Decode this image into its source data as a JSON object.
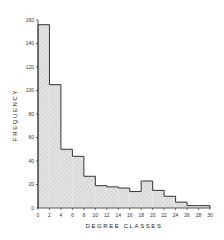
{
  "chart_data": {
    "type": "bar",
    "subtype": "histogram",
    "title": "",
    "xlabel": "DEGREE CLASSES",
    "ylabel": "FREQUENCY",
    "bin_edges": [
      0,
      2,
      4,
      6,
      8,
      10,
      12,
      14,
      16,
      18,
      20,
      22,
      24,
      26,
      28,
      30
    ],
    "categories": [
      "0-2",
      "2-4",
      "4-6",
      "6-8",
      "8-10",
      "10-12",
      "12-14",
      "14-16",
      "16-18",
      "18-20",
      "20-22",
      "22-24",
      "24-26",
      "26-28",
      "28-30"
    ],
    "values": [
      156,
      105,
      50,
      44,
      27,
      19,
      18,
      17,
      14,
      23,
      15,
      10,
      5,
      2,
      2
    ],
    "xlim": [
      0,
      30
    ],
    "ylim": [
      0,
      160
    ],
    "x_ticks": [
      "0",
      "2",
      "4",
      "6",
      "8",
      "10",
      "12",
      "14",
      "16",
      "18",
      "20",
      "22",
      "24",
      "26",
      "28",
      "30"
    ],
    "y_ticks": [
      "0",
      "20",
      "40",
      "60",
      "80",
      "100",
      "120",
      "140",
      "160"
    ],
    "grid": false,
    "legend": null,
    "fill": "hatched light gray",
    "colors": {
      "bar_fill": "#d6d6d6",
      "bar_edge": "#333333",
      "axis": "#333333"
    }
  }
}
